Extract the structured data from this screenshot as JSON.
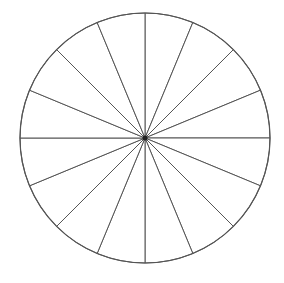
{
  "chart_data": {
    "type": "pie",
    "title": "",
    "categories": [
      "",
      "",
      "",
      "",
      "",
      "",
      "",
      "",
      "",
      "",
      "",
      "",
      "",
      "",
      "",
      ""
    ],
    "values": [
      1,
      1,
      1,
      1,
      1,
      1,
      1,
      1,
      1,
      1,
      1,
      1,
      1,
      1,
      1,
      1
    ],
    "slice_count": 16,
    "labels_visible": false,
    "legend": false,
    "fill_color": "#ffffff",
    "stroke_color": "#555555",
    "center": [
      145,
      138
    ],
    "radius": 125
  }
}
